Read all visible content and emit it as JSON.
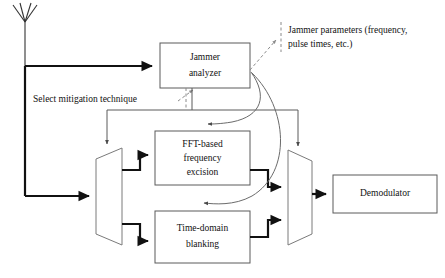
{
  "diagram": {
    "blocks": [
      {
        "id": "jammer_analyzer",
        "label_line1": "Jammer",
        "label_line2": "analyzer"
      },
      {
        "id": "fft_excision",
        "label_line1": "FFT-based",
        "label_line2": "frequency",
        "label_line3": "excision"
      },
      {
        "id": "time_blanking",
        "label_line1": "Time-domain",
        "label_line2": "blanking"
      },
      {
        "id": "demodulator",
        "label_line1": "Demodulator"
      }
    ],
    "annotations": [
      {
        "id": "jammer_params",
        "line1": "Jammer parameters (frequency,",
        "line2": "pulse times, etc.)"
      },
      {
        "id": "select_technique",
        "line1": "Select mitigation technique"
      }
    ],
    "elements": {
      "antenna": "antenna",
      "demux": "demultiplexer-switch",
      "mux": "multiplexer-switch"
    },
    "colors": {
      "signal_path": "#111111",
      "block_outline": "#5a5a5a",
      "switch_outline": "#7a7a7a",
      "control_curve": "#6b6b6b",
      "dashed_leader": "#8a8a8a",
      "background": "#ffffff",
      "text": "#111111"
    }
  }
}
